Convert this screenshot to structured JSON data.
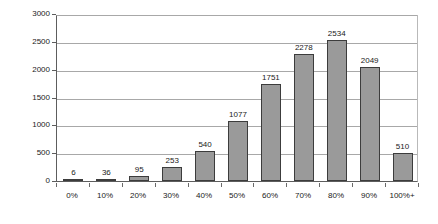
{
  "chart_data": {
    "type": "bar",
    "title": "",
    "subtitle": "",
    "xlabel": "",
    "ylabel": "",
    "categories": [
      "0%",
      "10%",
      "20%",
      "30%",
      "40%",
      "50%",
      "60%",
      "70%",
      "80%",
      "90%",
      "100%+"
    ],
    "values": [
      6,
      36,
      95,
      253,
      540,
      1077,
      1751,
      2278,
      2534,
      2049,
      510
    ],
    "data_labels": [
      "6",
      "36",
      "95",
      "253",
      "540",
      "1077",
      "1751",
      "2278",
      "2534",
      "2049",
      "510"
    ],
    "ylim": [
      0,
      3000
    ],
    "ytick_labels": [
      "3000",
      "2500",
      "2000",
      "1500",
      "1000",
      "500",
      "0"
    ],
    "yticks": [
      3000,
      2500,
      2000,
      1500,
      1000,
      500,
      0
    ],
    "grid": true,
    "legend": false,
    "legend_position": "none",
    "series": [
      {
        "name": "",
        "values": [
          6,
          36,
          95,
          253,
          540,
          1077,
          1751,
          2278,
          2534,
          2049,
          510
        ]
      }
    ],
    "colors": {
      "bar_fill": "#9a9a9a",
      "bar_border": "#3c3c3c",
      "gridline": "#a8a8a8",
      "axis": "#5d5d5d",
      "text": "#1a1a1a",
      "background": "#ffffff"
    }
  }
}
